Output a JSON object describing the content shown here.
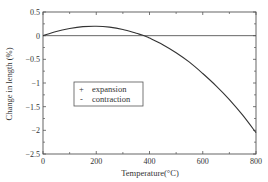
{
  "chart_data": {
    "type": "line",
    "title": "",
    "xlabel": "Temperature(°C)",
    "ylabel": "Change in length (%)",
    "xlim": [
      0,
      800
    ],
    "ylim": [
      -2.5,
      0.5
    ],
    "x_ticks": [
      0,
      200,
      400,
      600,
      800
    ],
    "x_tick_labels": [
      "0",
      "200",
      "400",
      "600",
      "800"
    ],
    "y_ticks": [
      0.5,
      0,
      -0.5,
      -1,
      -1.5,
      -2,
      -2.5
    ],
    "y_tick_labels": [
      "0.5",
      "0",
      "−0.5",
      "−1",
      "−1.5",
      "−2",
      "−2.5"
    ],
    "grid": false,
    "reference_line": {
      "y": 0
    },
    "legend": {
      "position": "inside-left-middle",
      "entries": [
        {
          "marker": "+",
          "label": "expansion"
        },
        {
          "marker": "-",
          "label": "contraction"
        }
      ]
    },
    "series": [
      {
        "name": "Change in length",
        "x": [
          0,
          50,
          100,
          150,
          200,
          250,
          300,
          350,
          380,
          400,
          450,
          500,
          550,
          600,
          650,
          700,
          750,
          800
        ],
        "y": [
          0,
          0.09,
          0.15,
          0.19,
          0.2,
          0.18,
          0.13,
          0.05,
          0,
          -0.05,
          -0.19,
          -0.36,
          -0.56,
          -0.8,
          -1.06,
          -1.35,
          -1.68,
          -2.05
        ]
      }
    ]
  }
}
